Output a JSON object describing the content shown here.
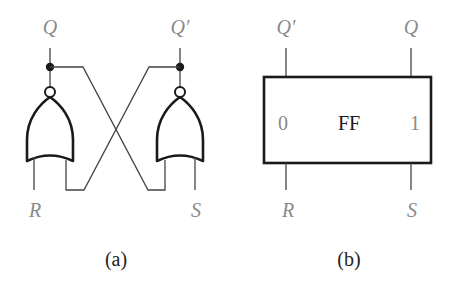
{
  "figure_a": {
    "caption": "(a)",
    "outputs": {
      "left": "Q",
      "right": "Q′"
    },
    "inputs": {
      "left": "R",
      "right": "S"
    },
    "gate_type": "NOR"
  },
  "figure_b": {
    "caption": "(b)",
    "block_label": "FF",
    "pin_left": "0",
    "pin_right": "1",
    "outputs": {
      "left": "Q′",
      "right": "Q"
    },
    "inputs": {
      "left": "R",
      "right": "S"
    }
  },
  "colors": {
    "line": "#1a1a1a",
    "wire": "#444444",
    "label": "#8a8a8a"
  }
}
